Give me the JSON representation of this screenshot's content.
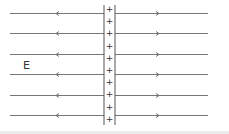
{
  "diagram": {
    "field_label": "E",
    "charge_symbol": "+",
    "charge_count": 10,
    "line_count": 6,
    "left_arrow_direction": "left",
    "right_arrow_direction": "right",
    "colors": {
      "line": "#777777",
      "sheet": "#555555",
      "text": "#333333",
      "background": "#ffffff"
    }
  }
}
